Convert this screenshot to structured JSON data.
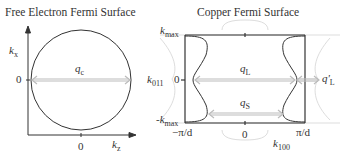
{
  "left_panel": {
    "title": "Free Electron Fermi Surface",
    "y_axis_label": "k",
    "y_axis_sub": "x",
    "x_axis_label": "k",
    "x_axis_sub": "z",
    "y_zero": "0",
    "x_zero": "0",
    "vector_label": "q",
    "vector_sub": "c"
  },
  "right_panel": {
    "title": "Copper Fermi Surface",
    "kmax_top": "k",
    "kmax_top_sub": "max",
    "kmax_bottom": "-k",
    "kmax_bottom_sub": "max",
    "k011": "k",
    "k011_sub": "011",
    "y_zero": "0",
    "x_left": "−π/d",
    "x_zero": "0",
    "x_right": "π/d",
    "k100": "k",
    "k100_sub": "100",
    "qL": "q",
    "qL_sub": "L",
    "qS": "q",
    "qS_sub": "S",
    "qLp": "q'",
    "qLp_sub": "L"
  },
  "colors": {
    "line": "#333333",
    "arrow": "#bbbbbb",
    "ghost": "#dddddd"
  }
}
